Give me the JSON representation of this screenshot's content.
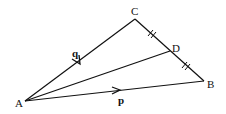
{
  "diagram": {
    "type": "triangle-vector-diagram",
    "points": {
      "A": {
        "label": "A",
        "x": 25,
        "y": 101
      },
      "B": {
        "label": "B",
        "x": 204,
        "y": 81
      },
      "C": {
        "label": "C",
        "x": 135,
        "y": 19
      },
      "D": {
        "label": "D",
        "x": 170,
        "y": 51
      }
    },
    "vectors": {
      "q": {
        "label": "q",
        "from": "A",
        "to": "C"
      },
      "p": {
        "label": "p",
        "from": "A",
        "to": "B"
      }
    },
    "segments": [
      "AC",
      "AB",
      "AD",
      "CB"
    ],
    "equal_marks": [
      "CD",
      "DB"
    ],
    "line_color": "#111111"
  }
}
